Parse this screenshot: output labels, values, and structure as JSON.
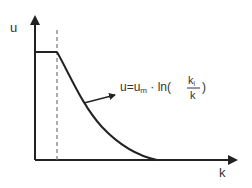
{
  "diagram": {
    "y_axis_label": "u",
    "x_axis_label": "k",
    "formula": {
      "lhs": "u=u",
      "lhs_sub": "m",
      "op": " · ln(",
      "num": "k",
      "num_sub": "i",
      "den": "k",
      "close": ")"
    },
    "colors": {
      "line": "#222222",
      "dashed": "#777777",
      "background": "#ffffff"
    }
  }
}
